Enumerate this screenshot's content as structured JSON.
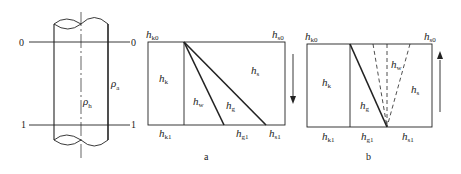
{
  "figure": {
    "pipe": {
      "section_top_left": "0",
      "section_top_right": "0",
      "section_bottom_left": "1",
      "section_bottom_right": "1",
      "rho_inside": {
        "symbol": "ρ",
        "sub": "h"
      },
      "rho_outside": {
        "symbol": "ρ",
        "sub": "a"
      }
    },
    "panel_a": {
      "caption": "a",
      "top_left": {
        "symbol": "h",
        "sub": "k0"
      },
      "top_right": {
        "symbol": "h",
        "sub": "s0"
      },
      "region_k": {
        "symbol": "h",
        "sub": "k"
      },
      "region_w": {
        "symbol": "h",
        "sub": "w"
      },
      "region_g": {
        "symbol": "h",
        "sub": "g"
      },
      "region_s": {
        "symbol": "h",
        "sub": "s"
      },
      "bottom_k1": {
        "symbol": "h",
        "sub": "k1"
      },
      "bottom_g1": {
        "symbol": "h",
        "sub": "g1"
      },
      "bottom_s1": {
        "symbol": "h",
        "sub": "s1"
      },
      "arrow_direction": "down"
    },
    "panel_b": {
      "caption": "b",
      "top_left": {
        "symbol": "h",
        "sub": "k0"
      },
      "top_right": {
        "symbol": "h",
        "sub": "s0"
      },
      "region_k": {
        "symbol": "h",
        "sub": "k"
      },
      "region_g": {
        "symbol": "h",
        "sub": "g"
      },
      "region_w": {
        "symbol": "h",
        "sub": "w"
      },
      "region_s": {
        "symbol": "h",
        "sub": "s"
      },
      "bottom_k1": {
        "symbol": "h",
        "sub": "k1"
      },
      "bottom_g1": {
        "symbol": "h",
        "sub": "g1"
      },
      "bottom_s1": {
        "symbol": "h",
        "sub": "s1"
      },
      "arrow_direction": "up"
    },
    "colors": {
      "line": "#222222",
      "background": "#ffffff"
    }
  }
}
